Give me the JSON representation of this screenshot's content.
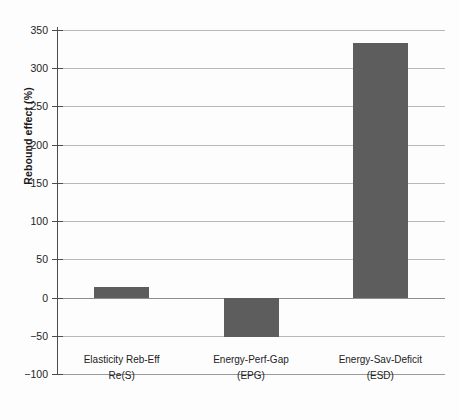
{
  "chart_data": {
    "type": "bar",
    "title": "",
    "xlabel": "",
    "ylabel": "Rebound effect (%)",
    "categories": [
      "Elasticity Reb-Eff",
      "Energy-Perf-Gap",
      "Energy-Sav-Deficit"
    ],
    "category_codes": [
      "Re(S)",
      "(EPG)",
      "(ESD)"
    ],
    "values": [
      14,
      -52,
      333
    ],
    "ylim": [
      -100,
      350
    ],
    "yticks": [
      350,
      300,
      250,
      200,
      150,
      100,
      50,
      0,
      -50,
      -100
    ],
    "ytick_labels": [
      "350",
      "300",
      "250",
      "200",
      "150",
      "100",
      "50",
      "0",
      "−50",
      "−100"
    ],
    "grid": true,
    "legend": "none",
    "bar_color": "#5d5d5d",
    "grid_color": "#b9b9b9",
    "axis_color": "#4c4c4c",
    "background_color": "#fdfdfd"
  }
}
